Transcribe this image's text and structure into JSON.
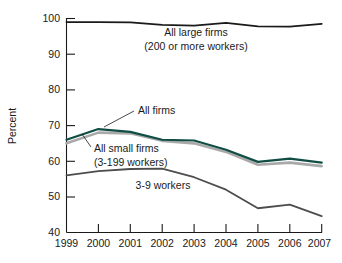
{
  "chart_data": {
    "type": "line",
    "title": "",
    "xlabel": "",
    "ylabel": "Percent",
    "x": [
      1999,
      2000,
      2001,
      2002,
      2003,
      2004,
      2005,
      2006,
      2007
    ],
    "xtick_labels": [
      "1999",
      "2000",
      "2001",
      "2002",
      "2003",
      "2004",
      "2005",
      "2006",
      "2007"
    ],
    "ytick_labels": [
      "40",
      "50",
      "60",
      "70",
      "80",
      "90",
      "100"
    ],
    "yticks": [
      40,
      50,
      60,
      70,
      80,
      90,
      100
    ],
    "ylim": [
      40,
      100
    ],
    "xlim": [
      1999,
      2007
    ],
    "grid": false,
    "legend": "inline-annotations",
    "series": [
      {
        "name": "All large firms (200 or more workers)",
        "color": "#1a1a1a",
        "values": [
          99.0,
          99.0,
          98.9,
          98.2,
          98.0,
          98.8,
          97.8,
          97.7,
          98.5
        ]
      },
      {
        "name": "All firms",
        "color": "#0f4d45",
        "values": [
          66.0,
          69.0,
          68.2,
          66.0,
          65.8,
          63.2,
          59.8,
          60.7,
          59.6
        ]
      },
      {
        "name": "All small firms (3-199 workers)",
        "color": "#a9a9a9",
        "values": [
          65.0,
          68.0,
          67.8,
          65.7,
          65.0,
          62.6,
          59.0,
          59.6,
          58.6
        ]
      },
      {
        "name": "3-9 workers",
        "color": "#4d4d4d",
        "values": [
          56.0,
          57.2,
          57.8,
          57.9,
          55.5,
          52.0,
          46.8,
          47.8,
          44.6
        ]
      }
    ],
    "annotations": [
      {
        "id": "large-firms",
        "line1": "All large firms",
        "line2": "(200 or more workers)"
      },
      {
        "id": "all-firms",
        "line1": "All firms",
        "line2": ""
      },
      {
        "id": "small-firms",
        "line1": "All small firms",
        "line2": "(3-199 workers)"
      },
      {
        "id": "three-to-nine",
        "line1": "3-9 workers",
        "line2": ""
      }
    ]
  },
  "axis": {
    "y_title": "Percent",
    "y_ticks": [
      "100",
      "90",
      "80",
      "70",
      "60",
      "50",
      "40"
    ],
    "x_ticks": [
      "1999",
      "2000",
      "2001",
      "2002",
      "2003",
      "2004",
      "2005",
      "2006",
      "2007"
    ]
  },
  "labels": {
    "large_firms_l1": "All large firms",
    "large_firms_l2": "(200 or more workers)",
    "all_firms": "All firms",
    "small_firms_l1": "All small firms",
    "small_firms_l2": "(3-199 workers)",
    "workers_3_9": "3-9 workers"
  },
  "colors": {
    "all_firms": "#0f4d45",
    "small_firms": "#a9a9a9",
    "large_firms": "#1a1a1a",
    "workers_3_9": "#4d4d4d",
    "axis": "#1a1a1a",
    "background": "#ffffff"
  }
}
